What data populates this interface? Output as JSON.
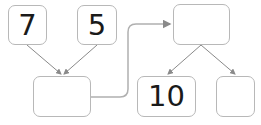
{
  "diagram": {
    "type": "number-bond-flow",
    "nodes": [
      {
        "id": "a",
        "value": "7"
      },
      {
        "id": "b",
        "value": "5"
      },
      {
        "id": "sum",
        "value": ""
      },
      {
        "id": "top",
        "value": ""
      },
      {
        "id": "part1",
        "value": "10"
      },
      {
        "id": "part2",
        "value": ""
      }
    ],
    "edges": [
      {
        "from": "a",
        "to": "sum"
      },
      {
        "from": "b",
        "to": "sum"
      },
      {
        "from": "sum",
        "to": "top"
      },
      {
        "from": "top",
        "to": "part1"
      },
      {
        "from": "top",
        "to": "part2"
      }
    ],
    "colors": {
      "border": "#b8b8b8",
      "arrow": "#8a8a8a",
      "text": "#1a1a1a"
    }
  }
}
